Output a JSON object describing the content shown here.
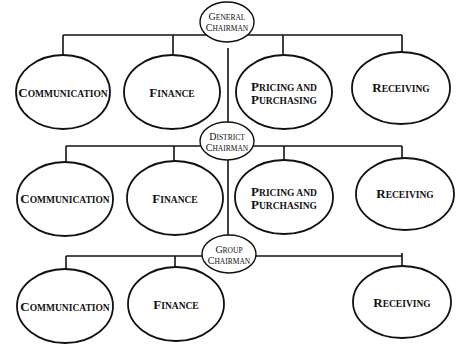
{
  "diagram": {
    "type": "organization-chart",
    "levels": [
      {
        "chairman": {
          "line1": "General",
          "line2": "Chairman"
        },
        "departments": [
          "Communication",
          "Finance",
          "Pricing and Purchasing",
          "Receiving"
        ]
      },
      {
        "chairman": {
          "line1": "District",
          "line2": "Chairman"
        },
        "departments": [
          "Communication",
          "Finance",
          "Pricing and Purchasing",
          "Receiving"
        ]
      },
      {
        "chairman": {
          "line1": "Group",
          "line2": "Chairman"
        },
        "departments": [
          "Communication",
          "Finance",
          "Receiving"
        ]
      }
    ]
  },
  "labels": {
    "general": {
      "l1c": "G",
      "l1r": "ENERAL",
      "l2c": "C",
      "l2r": "HAIRMAN"
    },
    "district": {
      "l1c": "D",
      "l1r": "ISTRICT",
      "l2c": "C",
      "l2r": "HAIRMAN"
    },
    "group": {
      "l1c": "G",
      "l1r": "ROUP",
      "l2c": "C",
      "l2r": "HAIRMAN"
    },
    "communication": {
      "c": "C",
      "r": "OMMUNICATION"
    },
    "finance": {
      "c": "F",
      "r": "INANCE"
    },
    "pricing": {
      "c": "P",
      "r": "RICING AND"
    },
    "purchasing": {
      "c": "P",
      "r": "URCHASING"
    },
    "receiving": {
      "c": "R",
      "r": "ECEIVING"
    }
  }
}
